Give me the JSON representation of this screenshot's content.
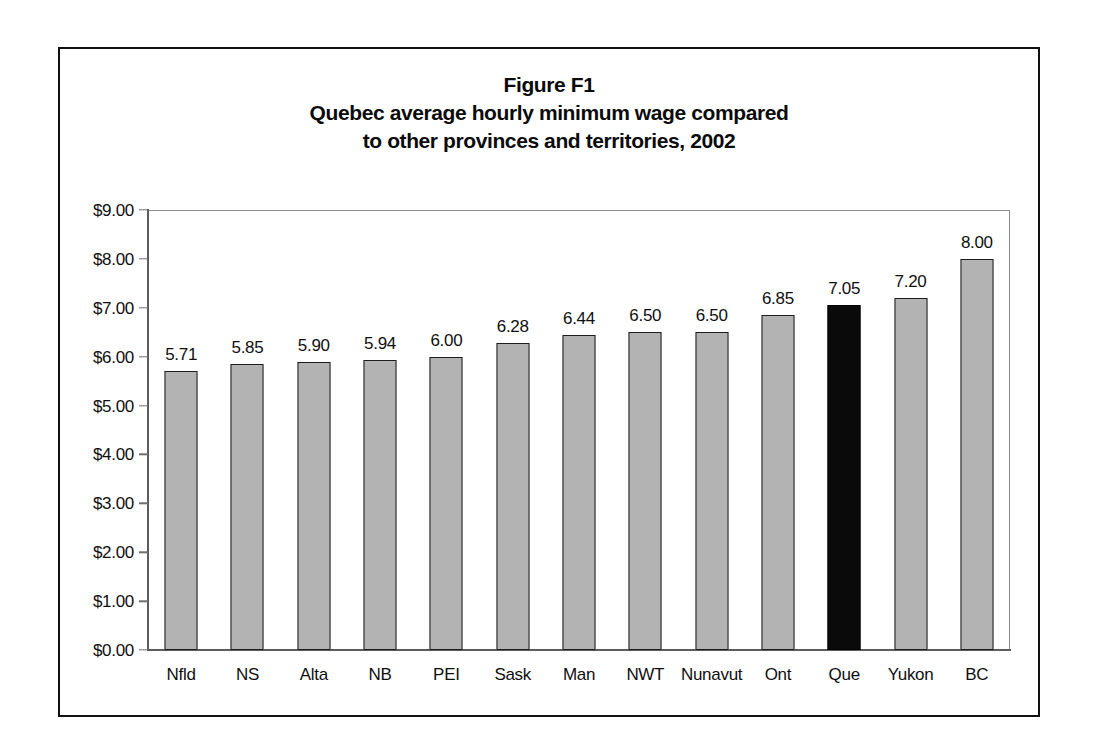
{
  "figure": {
    "title_lines": [
      "Figure F1",
      "Quebec average hourly minimum wage compared",
      "to other provinces and territories, 2002"
    ]
  },
  "chart_data": {
    "type": "bar",
    "title": "Figure F1 Quebec average hourly minimum wage compared to other provinces and territories, 2002",
    "xlabel": "",
    "ylabel": "",
    "ylim": [
      0,
      9
    ],
    "ytick_step": 1,
    "ytick_labels": [
      "$0.00",
      "$1.00",
      "$2.00",
      "$3.00",
      "$4.00",
      "$5.00",
      "$6.00",
      "$7.00",
      "$8.00",
      "$9.00"
    ],
    "ytick_values": [
      0,
      1,
      2,
      3,
      4,
      5,
      6,
      7,
      8,
      9
    ],
    "grid": false,
    "legend": "none",
    "categories": [
      "Nfld",
      "NS",
      "Alta",
      "NB",
      "PEI",
      "Sask",
      "Man",
      "NWT",
      "Nunavut",
      "Ont",
      "Que",
      "Yukon",
      "BC"
    ],
    "values": [
      5.71,
      5.85,
      5.9,
      5.94,
      6.0,
      6.28,
      6.44,
      6.5,
      6.5,
      6.85,
      7.05,
      7.2,
      8.0
    ],
    "value_labels": [
      "5.71",
      "5.85",
      "5.90",
      "5.94",
      "6.00",
      "6.28",
      "6.44",
      "6.50",
      "6.50",
      "6.85",
      "7.05",
      "7.20",
      "8.00"
    ],
    "highlight_category": "Que",
    "colors": {
      "bar_fill": "#b3b3b3",
      "bar_border": "#1c1c1c",
      "highlight_fill": "#0a0a0a",
      "axis": "#6f6f6f",
      "text": "#0f0f0f",
      "frame": "#111111",
      "background": "#ffffff"
    }
  }
}
